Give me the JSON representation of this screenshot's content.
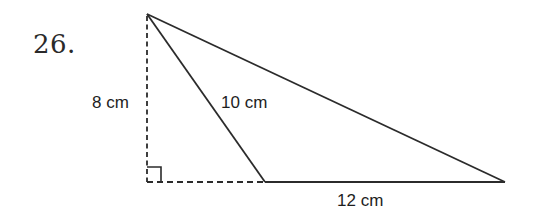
{
  "problem": {
    "number": "26."
  },
  "diagram": {
    "type": "obtuse triangle with altitude",
    "labels": {
      "height": "8 cm",
      "slant_side": "10 cm",
      "base": "12 cm"
    },
    "right_angle_marker": true,
    "colors": {
      "stroke": "#2b2b2b",
      "text": "#1e1e1e",
      "background": "#ffffff"
    },
    "vertices": {
      "apex": [
        147,
        14
      ],
      "foot_of_altitude": [
        147,
        182
      ],
      "base_left": [
        265,
        182
      ],
      "base_right": [
        505,
        182
      ]
    }
  }
}
